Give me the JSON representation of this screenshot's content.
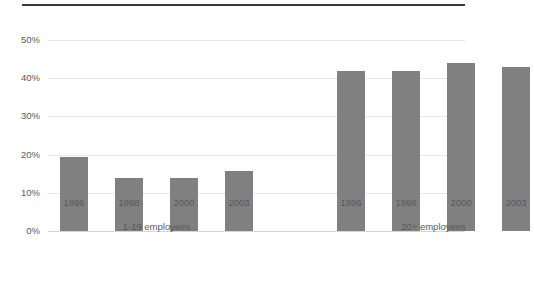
{
  "chart_data": {
    "type": "bar",
    "title": "",
    "subtitle": "",
    "xlabel": "",
    "ylabel": "",
    "ylim": [
      0,
      50
    ],
    "grid": true,
    "legend_position": "none",
    "orientation": "vertical",
    "bar_color": "#808080",
    "gridline_color": "#e6e6e6",
    "axis_color": "#d5d5d5",
    "rule_color": "#3c3a39",
    "text_color": "#595959",
    "y_ticks": [
      {
        "value": 50,
        "label": "50%"
      },
      {
        "value": 40,
        "label": "40%"
      },
      {
        "value": 30,
        "label": "30%"
      },
      {
        "value": 20,
        "label": "20%"
      },
      {
        "value": 10,
        "label": "10%"
      },
      {
        "value": 0,
        "label": "0%"
      }
    ],
    "categories": [
      "1996",
      "1998",
      "2000",
      "2003"
    ],
    "groups": [
      {
        "label": "1-19 employees",
        "bars": [
          {
            "category": "1996",
            "value": 19.5
          },
          {
            "category": "1998",
            "value": 13.8
          },
          {
            "category": "2000",
            "value": 13.8
          },
          {
            "category": "2003",
            "value": 15.7
          }
        ]
      },
      {
        "label": "20+ employees",
        "bars": [
          {
            "category": "1996",
            "value": 42.0
          },
          {
            "category": "1998",
            "value": 42.0
          },
          {
            "category": "2000",
            "value": 44.0
          },
          {
            "category": "2003",
            "value": 43.0
          }
        ]
      }
    ],
    "series": [
      {
        "name": "1-19 employees",
        "values": [
          19.5,
          13.8,
          13.8,
          15.7
        ]
      },
      {
        "name": "20+ employees",
        "values": [
          42.0,
          42.0,
          44.0,
          43.0
        ]
      }
    ]
  }
}
